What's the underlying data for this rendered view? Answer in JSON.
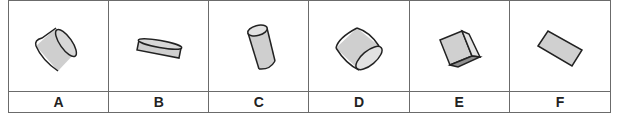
{
  "question": {
    "options": [
      {
        "label": "A",
        "shape": "cylinder",
        "description": "short cylinder tilted, circular face on right"
      },
      {
        "label": "B",
        "shape": "cylinder",
        "description": "flat disc-like cylinder, nearly horizontal"
      },
      {
        "label": "C",
        "shape": "cylinder",
        "description": "upright cylinder tilted slightly, circular face on top"
      },
      {
        "label": "D",
        "shape": "cylinder",
        "description": "short wide cylinder tilted, circular face lower right"
      },
      {
        "label": "E",
        "shape": "cube",
        "description": "cube rotated showing three faces"
      },
      {
        "label": "F",
        "shape": "rectangle",
        "description": "flat rectangular slab tilted diagonally"
      }
    ]
  },
  "colors": {
    "fill": "#cfcfcf",
    "fill_dark": "#9a9a9a",
    "stroke": "#222222",
    "grid": "#6b6b6b"
  }
}
